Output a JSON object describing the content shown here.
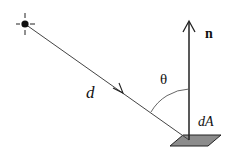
{
  "diagram": {
    "labels": {
      "distance": "d",
      "angle": "θ",
      "normal": "n",
      "area": "dA"
    },
    "colors": {
      "stroke": "#333333",
      "patch_fill": "#8c8c8c",
      "patch_stroke": "#222222",
      "background": "#ffffff"
    },
    "elements": [
      {
        "id": "light-source",
        "type": "point-light",
        "center": [
          25,
          24
        ]
      },
      {
        "id": "light-ray",
        "type": "arrow-line",
        "from": [
          25,
          24
        ],
        "to": [
          189,
          140
        ]
      },
      {
        "id": "surface-normal",
        "type": "arrow",
        "from": [
          189,
          140
        ],
        "to": [
          189,
          22
        ]
      },
      {
        "id": "angle-arc",
        "type": "arc",
        "between": [
          "light-ray",
          "surface-normal"
        ]
      },
      {
        "id": "surface-patch",
        "type": "parallelogram",
        "points": [
          [
            170,
            146
          ],
          [
            183,
            135
          ],
          [
            221,
            135
          ],
          [
            208,
            146
          ]
        ]
      }
    ]
  }
}
